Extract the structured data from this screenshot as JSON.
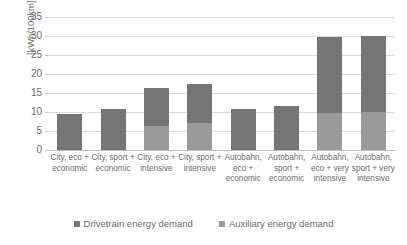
{
  "chart_data": {
    "type": "bar",
    "subtype": "stacked-bar",
    "title": "",
    "xlabel": "",
    "ylabel": "[kWh/100km]",
    "ylim": [
      0,
      35
    ],
    "ytick_values": [
      35,
      30,
      25,
      20,
      15,
      10,
      5,
      0
    ],
    "ytick_labels": [
      "35",
      "30",
      "25",
      "20",
      "15",
      "10",
      "5",
      "0"
    ],
    "grid": true,
    "legend_position": "bottom",
    "categories": [
      "City, eco + economic",
      "City, sport + economic",
      "City, eco + intensive",
      "City, sport + intensive",
      "Autobahn, eco + economic",
      "Autobahn, sport + economic",
      "Autobahn, eco + very intensive",
      "Autobahn, sport + very intensive"
    ],
    "series": [
      {
        "name": "Drivetrain energy demand",
        "color": "#757575",
        "values": [
          9.5,
          10.8,
          10.0,
          10.4,
          10.8,
          11.5,
          20.0,
          20.0
        ]
      },
      {
        "name": "Auxiliary energy demand",
        "color": "#9a9a9a",
        "values": [
          0.0,
          0.0,
          6.4,
          7.1,
          0.0,
          0.0,
          9.8,
          10.0
        ]
      }
    ],
    "totals": [
      9.5,
      10.8,
      16.4,
      17.5,
      10.8,
      11.5,
      29.8,
      30.0
    ]
  },
  "legend": {
    "items": [
      {
        "label": "Drivetrain energy demand",
        "color": "#757575"
      },
      {
        "label": "Auxiliary energy demand",
        "color": "#9a9a9a"
      }
    ]
  },
  "axis": {
    "y_title": "[kWh/100km]"
  }
}
